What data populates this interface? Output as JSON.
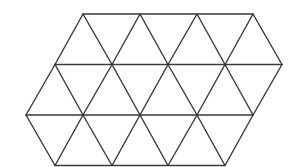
{
  "diagram": {
    "title": "",
    "background": "#ffffff",
    "stroke_color": "#3a3a3a",
    "stroke_width": 1.4,
    "rows": 3,
    "triangle_side_px": 57,
    "row_height_px": 50.5,
    "row_y": [
      14,
      64.5,
      115,
      165.5
    ],
    "row_vertices_x": [
      [
        83,
        140,
        197,
        253
      ],
      [
        55,
        112,
        168,
        225,
        282
      ],
      [
        26,
        83,
        140,
        197,
        253
      ],
      [
        55,
        112,
        168,
        225
      ]
    ],
    "triangle_count": 21
  }
}
